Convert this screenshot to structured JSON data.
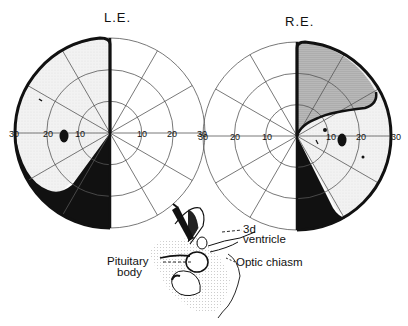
{
  "figure": {
    "left_eye": {
      "title": "L.E.",
      "center": [
        110,
        133
      ],
      "radius": 95,
      "rings_deg": [
        10,
        20,
        30
      ],
      "tick_labels_left": [
        "30",
        "20",
        "10"
      ],
      "tick_labels_right": [
        "10",
        "20",
        "30"
      ],
      "defects": {
        "temporal_hemianopia_region": "left half field (light stippled)",
        "dense_scotoma": "lower temporal quadrant (black)",
        "blind_spot": "black oval at ~15° temporal"
      }
    },
    "right_eye": {
      "title": "R.E.",
      "center": [
        297,
        136
      ],
      "radius": 94,
      "rings_deg": [
        10,
        20,
        30
      ],
      "tick_labels_left": [
        "30",
        "20",
        "10"
      ],
      "tick_labels_right": [
        "10",
        "20",
        "30"
      ],
      "defects": {
        "upper_temporal_quadrant": "dense stippled defect",
        "lower_temporal_wedge": "black wedge",
        "remaining_temporal": "light stippled",
        "blind_spot": "black oval at ~15° temporal"
      }
    },
    "anatomy": {
      "labels": {
        "third_ventricle_line1": "3d",
        "third_ventricle_line2": "ventricle",
        "pituitary_line1": "Pituitary",
        "pituitary_line2": "body",
        "optic_chiasm": "Optic chiasm"
      }
    },
    "colors": {
      "ink": "#111111",
      "grid": "#555555",
      "light_fill": "#ececec",
      "dense_fill": "#9a9a9a"
    }
  }
}
